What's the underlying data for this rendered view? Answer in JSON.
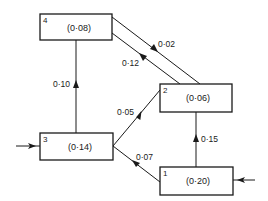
{
  "diagram": {
    "type": "compartment-flow",
    "colors": {
      "stroke": "#1a1a1a",
      "background": "#ffffff"
    },
    "compartments": [
      {
        "id": "1",
        "value": "(0·20)"
      },
      {
        "id": "2",
        "value": "(0·06)"
      },
      {
        "id": "3",
        "value": "(0·14)"
      },
      {
        "id": "4",
        "value": "(0·08)"
      }
    ],
    "flows": [
      {
        "from": "3",
        "to": "4",
        "label": "0·10"
      },
      {
        "from": "4",
        "to": "2",
        "label": "0·02"
      },
      {
        "from": "2",
        "to": "4",
        "label": "0·12"
      },
      {
        "from": "3",
        "to": "2",
        "label": "0·05"
      },
      {
        "from": "1",
        "to": "3",
        "label": "0·07"
      },
      {
        "from": "1",
        "to": "2",
        "label": "0·15"
      }
    ],
    "inputs": [
      {
        "to": "3",
        "side": "left"
      },
      {
        "to": "1",
        "side": "right"
      }
    ]
  }
}
